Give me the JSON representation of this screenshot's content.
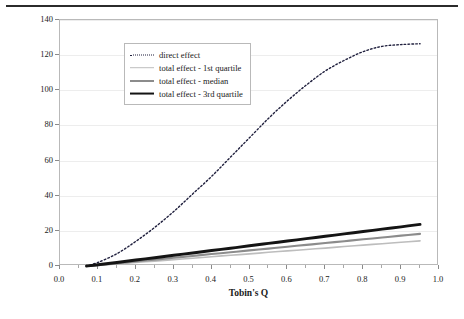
{
  "figure": {
    "has_top_rule": true,
    "background": "#ffffff"
  },
  "chart_data": {
    "type": "line",
    "title": "",
    "xlabel": "Tobin's Q",
    "ylabel": "Managerial and board ownership",
    "xlim": [
      0.0,
      1.0
    ],
    "ylim": [
      0,
      140
    ],
    "grid": true,
    "grid_axis": "y",
    "legend_position": "top-left",
    "x_ticks": [
      "0.0",
      "0.1",
      "0.2",
      "0.3",
      "0.4",
      "0.5",
      "0.6",
      "0.7",
      "0.8",
      "0.9",
      "1.0"
    ],
    "y_ticks": [
      "0",
      "20",
      "40",
      "60",
      "80",
      "100",
      "120",
      "140"
    ],
    "x": [
      0.07,
      0.1,
      0.15,
      0.2,
      0.25,
      0.3,
      0.35,
      0.4,
      0.45,
      0.5,
      0.55,
      0.6,
      0.65,
      0.7,
      0.75,
      0.8,
      0.85,
      0.9,
      0.95
    ],
    "series": [
      {
        "name": "direct effect",
        "style": "dotted",
        "color": "#1f1f3d",
        "width": 1.4,
        "values": [
          0,
          2,
          7,
          14,
          22,
          31,
          41,
          51,
          62,
          73,
          84,
          94,
          103,
          111,
          117,
          122,
          125,
          126,
          126.5
        ]
      },
      {
        "name": "total effect - 1st quartile",
        "style": "solid",
        "color": "#bdbdbd",
        "width": 1.6,
        "values": [
          0,
          0.4,
          1.2,
          2.0,
          2.8,
          3.6,
          4.4,
          5.3,
          6.1,
          6.9,
          7.8,
          8.6,
          9.4,
          10.2,
          11.1,
          11.9,
          12.7,
          13.5,
          14.3
        ]
      },
      {
        "name": "total effect - median",
        "style": "solid",
        "color": "#8c8c8c",
        "width": 2.1,
        "values": [
          0,
          0.5,
          1.5,
          2.6,
          3.6,
          4.7,
          5.7,
          6.8,
          7.8,
          8.9,
          9.9,
          11.0,
          12.0,
          13.1,
          14.1,
          15.2,
          16.2,
          17.3,
          18.3
        ]
      },
      {
        "name": "total effect - 3rd quartile",
        "style": "solid",
        "color": "#141414",
        "width": 2.9,
        "values": [
          0,
          0.7,
          2.0,
          3.4,
          4.7,
          6.1,
          7.4,
          8.8,
          10.1,
          11.5,
          12.9,
          14.2,
          15.6,
          16.9,
          18.3,
          19.6,
          21.0,
          22.3,
          23.7
        ]
      }
    ]
  },
  "legend": {
    "items": [
      {
        "label": "direct effect"
      },
      {
        "label": "total effect - 1st quartile"
      },
      {
        "label": "total effect - median"
      },
      {
        "label": "total effect - 3rd quartile"
      }
    ]
  }
}
